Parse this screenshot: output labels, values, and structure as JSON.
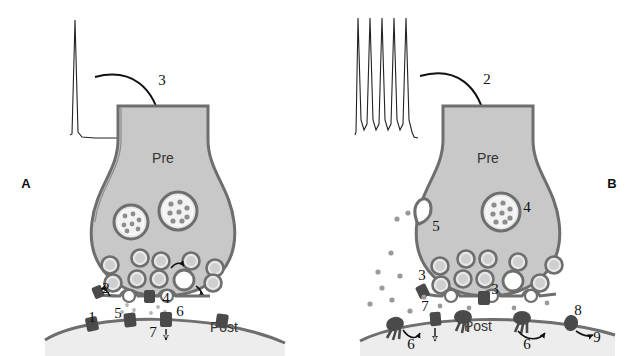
{
  "figure": {
    "background_color": "#ffffff",
    "cytoplasm_color": "#c8c8c8",
    "membrane_color": "#6e6e6e",
    "ink_color": "#111111",
    "vesicle_fill": "#e8e8e8",
    "transmitter_dot_color": "#9a9a9a",
    "receptor_color": "#4a4a4a"
  },
  "panels": [
    {
      "id": "A",
      "letter": "A",
      "letter_pos": {
        "x": 26,
        "y": 188
      },
      "terminal_label": "Pre",
      "terminal_label_pos": {
        "x": 163,
        "y": 163
      },
      "postsynaptic_label": "Post",
      "postsynaptic_label_pos": {
        "x": 224,
        "y": 332
      },
      "stimulus": {
        "type": "single-action-potential",
        "spike_count": 1,
        "description": "single spike trace"
      },
      "arrow_label": "3",
      "arrow_label_pos": {
        "x": 162,
        "y": 85
      },
      "callouts": [
        {
          "number": "1",
          "x": 92,
          "y": 322
        },
        {
          "number": "2",
          "x": 105,
          "y": 292
        },
        {
          "number": "3",
          "x": 162,
          "y": 85
        },
        {
          "number": "4",
          "x": 163,
          "y": 303
        },
        {
          "number": "5",
          "x": 118,
          "y": 318
        },
        {
          "number": "6",
          "x": 179,
          "y": 316
        },
        {
          "number": "7",
          "x": 154,
          "y": 334
        }
      ],
      "dense_core_vesicles": 2,
      "small_vesicles": 9,
      "fused_vesicles": 1
    },
    {
      "id": "B",
      "letter": "B",
      "letter_pos": {
        "x": 610,
        "y": 188
      },
      "terminal_label": "Pre",
      "terminal_label_pos": {
        "x": 488,
        "y": 163
      },
      "postsynaptic_label": "Post",
      "postsynaptic_label_pos": {
        "x": 478,
        "y": 331
      },
      "stimulus": {
        "type": "action-potential-train",
        "spike_count": 5,
        "description": "burst of five spikes"
      },
      "arrow_label": "2",
      "arrow_label_pos": {
        "x": 487,
        "y": 84
      },
      "callouts": [
        {
          "number": "2",
          "x": 487,
          "y": 84
        },
        {
          "number": "3",
          "x": 422,
          "y": 280
        },
        {
          "number": "3",
          "x": 493,
          "y": 295
        },
        {
          "number": "4",
          "x": 525,
          "y": 211
        },
        {
          "number": "5",
          "x": 434,
          "y": 229
        },
        {
          "number": "6",
          "x": 412,
          "y": 347
        },
        {
          "number": "6",
          "x": 525,
          "y": 347
        },
        {
          "number": "7",
          "x": 426,
          "y": 313
        },
        {
          "number": "8",
          "x": 578,
          "y": 317
        },
        {
          "number": "9",
          "x": 592,
          "y": 340
        }
      ],
      "dense_core_vesicles": 1,
      "small_vesicles": 10,
      "open_fusion_pore": 1,
      "released_transmitter_dots": 14
    }
  ]
}
